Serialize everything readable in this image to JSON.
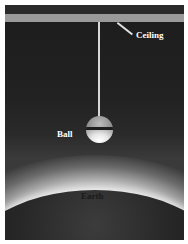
{
  "diagram": {
    "labels": {
      "ceiling": "Ceiling",
      "ball": "Ball",
      "earth": "Earth"
    },
    "colors": {
      "background": "#1c1c1c",
      "ceiling_band": "#9a9a9a",
      "string": "#d8d8d8",
      "earth_glow": "#ffffff",
      "label_light": "#ffffff",
      "label_dark": "#1a1a1a"
    }
  }
}
